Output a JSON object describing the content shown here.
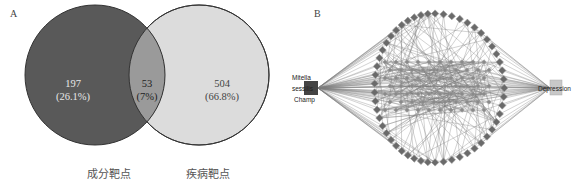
{
  "top_cut_text": "",
  "panel_a": {
    "letter": "A",
    "left_set": {
      "label": "成分靶点",
      "count": "197",
      "percent": "(26.1%)",
      "fill": "#595959"
    },
    "intersection": {
      "count": "53",
      "percent": "(7%)",
      "fill": "#9a9a9a"
    },
    "right_set": {
      "label": "疾病靶点",
      "count": "504",
      "percent": "(66.8%)",
      "fill": "#dcdcdc"
    },
    "outline_color": "#333333"
  },
  "panel_b": {
    "letter": "B",
    "left_hub": {
      "lines": [
        "Mitella",
        "sessilis",
        "Champ"
      ]
    },
    "right_hub": {
      "label": "Depression",
      "fill": "#c8c8c8"
    },
    "node_color": "#6a6a6a",
    "edge_color": "#7a7a7a",
    "ring_node_count": 53
  },
  "chart_data": {
    "type": "venn",
    "title": "",
    "sets": [
      {
        "name": "成分靶点",
        "exclusive": 197,
        "exclusive_percent": 26.1
      },
      {
        "name": "疾病靶点",
        "exclusive": 504,
        "exclusive_percent": 66.8
      }
    ],
    "intersection": {
      "sets": [
        "成分靶点",
        "疾病靶点"
      ],
      "value": 53,
      "percent": 7
    },
    "network": {
      "type": "network",
      "hubs": [
        "Mitella sessilis Champ",
        "Depression"
      ],
      "shared_target_nodes": 53
    }
  }
}
